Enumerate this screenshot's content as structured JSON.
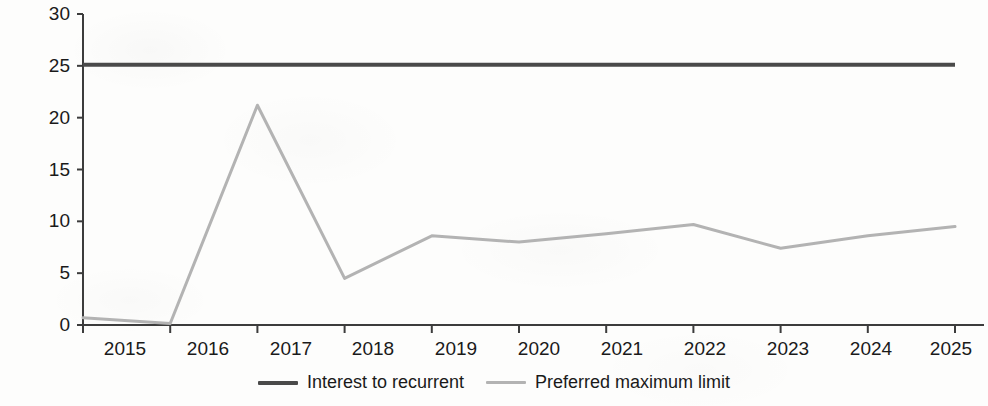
{
  "chart_data": {
    "type": "line",
    "title": "",
    "xlabel": "",
    "ylabel": "Liquidity ratio, %",
    "categories": [
      "2015",
      "2016",
      "2017",
      "2018",
      "2019",
      "2020",
      "2021",
      "2022",
      "2023",
      "2024",
      "2025"
    ],
    "x": [
      2015,
      2016,
      2017,
      2018,
      2019,
      2020,
      2021,
      2022,
      2023,
      2024,
      2025
    ],
    "xlim": [
      2015,
      2025
    ],
    "ylim": [
      0,
      30
    ],
    "yticks": [
      0,
      5,
      10,
      15,
      20,
      25,
      30
    ],
    "ytick_labels": [
      "0",
      "5",
      "10",
      "15",
      "20",
      "25",
      "30"
    ],
    "grid": false,
    "legend_position": "bottom-center",
    "series": [
      {
        "name": "Interest to recurrent",
        "color": "#4a4a4a",
        "linewidth": 4,
        "values": [
          25.1,
          25.1,
          25.1,
          25.1,
          25.1,
          25.1,
          25.1,
          25.1,
          25.1,
          25.1,
          25.1
        ]
      },
      {
        "name": "Preferred maximum limit",
        "color": "#b3b3b3",
        "linewidth": 3,
        "values": [
          0.7,
          0.15,
          21.2,
          4.5,
          8.6,
          8.0,
          8.8,
          9.7,
          7.4,
          8.6,
          9.5
        ]
      }
    ]
  },
  "axis": {
    "y_label": "Liquidity ratio, %",
    "y_ticks": [
      "30",
      "25",
      "20",
      "15",
      "10",
      "5",
      "0"
    ],
    "x_ticks": [
      "2015",
      "2016",
      "2017",
      "2018",
      "2019",
      "2020",
      "2021",
      "2022",
      "2023",
      "2024",
      "2025"
    ],
    "axis_color": "#3c3c3c"
  },
  "legend": {
    "items": [
      {
        "label": "Interest to recurrent",
        "color": "#4a4a4a"
      },
      {
        "label": "Preferred maximum limit",
        "color": "#b3b3b3"
      }
    ]
  }
}
